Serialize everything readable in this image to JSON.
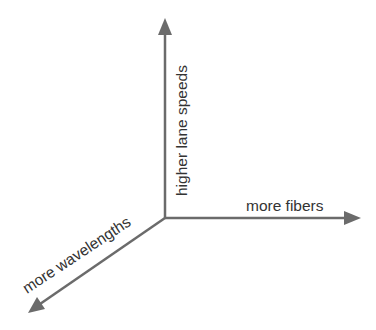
{
  "diagram": {
    "type": "3-axis growth diagram",
    "axes": [
      {
        "id": "vertical",
        "label": "higher lane speeds",
        "direction": "up"
      },
      {
        "id": "horizontal",
        "label": "more fibers",
        "direction": "right"
      },
      {
        "id": "diagonal",
        "label": "more wavelengths",
        "direction": "down-left"
      }
    ],
    "colors": {
      "axis": "#6b6b6b",
      "text": "#333333",
      "background": "#ffffff"
    }
  }
}
